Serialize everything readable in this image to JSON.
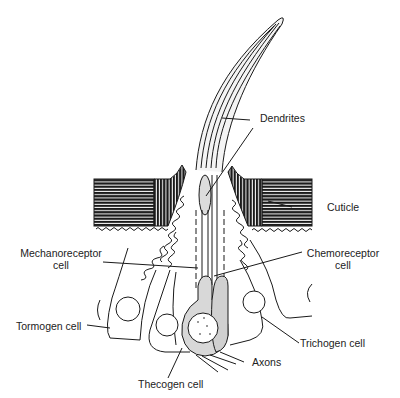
{
  "figure": {
    "colors": {
      "ink": "#1a1a1a",
      "background": "#ffffff",
      "shade": "#cfcfcf"
    },
    "labels": {
      "dendrites": "Dendrites",
      "cuticle": "Cuticle",
      "mechanoreceptor_line1": "Mechanoreceptor",
      "mechanoreceptor_line2": "cell",
      "chemoreceptor_line1": "Chemoreceptor",
      "chemoreceptor_line2": "cell",
      "tormogen": "Tormogen cell",
      "trichogen": "Trichogen cell",
      "axons": "Axons",
      "thecogen": "Thecogen cell"
    }
  }
}
